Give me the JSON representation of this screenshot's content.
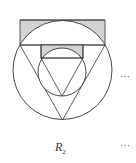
{
  "figure": {
    "label_main": "R",
    "label_sub": "2",
    "continuation_top": "···",
    "continuation_bottom": "···",
    "colors": {
      "stroke": "#333333",
      "shade": "#d3d3d3",
      "background": "#ffffff"
    }
  }
}
